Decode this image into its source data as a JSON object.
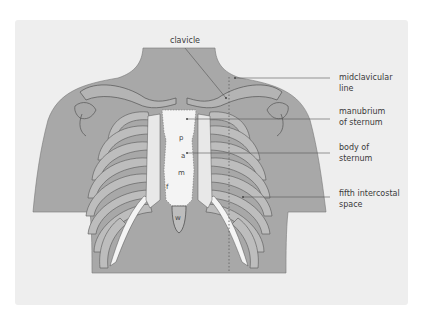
{
  "figure": {
    "colors": {
      "panel_background": "#eeeeee",
      "body_fill": "#a8a8a8",
      "bone_fill": "#f4f4f4",
      "cartilage_fill": "#e2e2e2",
      "rib_shadow": "#bdbdbd",
      "outline": "#555555",
      "leader_line": "#555555"
    },
    "labels": {
      "clavicle": "clavicle",
      "midclavicular_line": "midclavicular\nline",
      "manubrium": "manubrium\nof sternum",
      "body_of_sternum": "body of\nsternum",
      "fifth_intercostal": "fifth intercostal\nspace"
    },
    "sternum_letters": {
      "p": "p",
      "a": "a",
      "m": "m",
      "f": "f",
      "w": "w"
    }
  }
}
